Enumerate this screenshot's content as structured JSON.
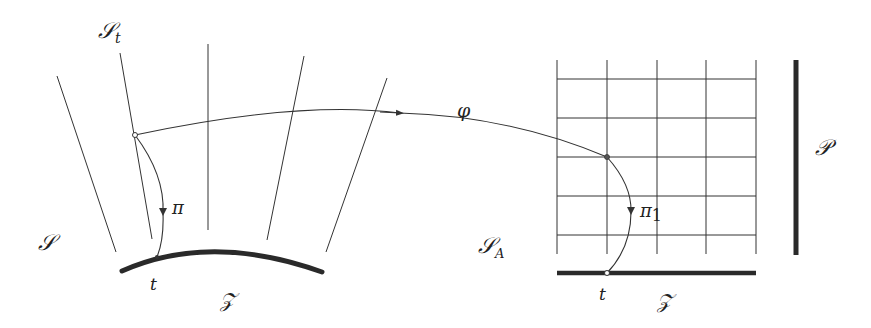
{
  "figure": {
    "left_panel": {
      "space_label": "𝒮",
      "fiber_label_main": "𝒮",
      "fiber_label_sub": "t",
      "projection_label": "π",
      "base_point_label": "t",
      "base_label": "𝒵",
      "fiber_lines": [
        {
          "x1": 57,
          "y1": 76,
          "x2": 116,
          "y2": 252
        },
        {
          "x1": 120,
          "y1": 53,
          "x2": 152,
          "y2": 239
        },
        {
          "x1": 208,
          "y1": 44,
          "x2": 208,
          "y2": 230
        },
        {
          "x1": 304,
          "y1": 56,
          "x2": 267,
          "y2": 240
        },
        {
          "x1": 387,
          "y1": 78,
          "x2": 326,
          "y2": 252
        }
      ]
    },
    "map": {
      "label": "φ"
    },
    "right_panel": {
      "space_label_main": "𝒮",
      "space_label_sub": "A",
      "projection_label_main": "π",
      "projection_label_sub": "1",
      "base_point_label": "t",
      "base_label": "𝒵",
      "fiber_space_label": "𝒫",
      "grid": {
        "x": [
          557,
          607,
          657,
          706,
          756
        ],
        "y": [
          79,
          118,
          157,
          196,
          235
        ],
        "top": 60,
        "bottom": 254
      }
    }
  }
}
